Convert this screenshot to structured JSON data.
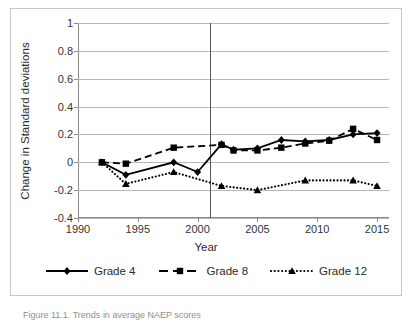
{
  "chart_data": {
    "type": "line",
    "title": "",
    "xlabel": "Year",
    "ylabel": "Change in Standard deviations",
    "xlim": [
      1990,
      2016
    ],
    "ylim": [
      -0.4,
      1.0
    ],
    "yticks": [
      1,
      0.8,
      0.6,
      0.4,
      0.2,
      0,
      -0.2,
      -0.4
    ],
    "ytick_labels": [
      "1",
      "0.8",
      "0.6",
      "0.4",
      "0.2",
      "0",
      "-0.2",
      "-0.4"
    ],
    "xticks": [
      1990,
      1995,
      2000,
      2005,
      2010,
      2015
    ],
    "xtick_labels": [
      "1990",
      "1995",
      "2000",
      "2005",
      "2010",
      "2015"
    ],
    "grid": true,
    "legend_position": "bottom",
    "annotations": [
      {
        "name": "reference-line",
        "type": "vline",
        "x": 2001
      }
    ],
    "series": [
      {
        "name": "Grade 4",
        "marker": "diamond",
        "linestyle": "solid",
        "color": "#000000",
        "points": [
          {
            "x": 1992,
            "y": 0.0
          },
          {
            "x": 1994,
            "y": -0.09
          },
          {
            "x": 1998,
            "y": 0.0
          },
          {
            "x": 2000,
            "y": -0.07
          },
          {
            "x": 2002,
            "y": 0.13
          },
          {
            "x": 2003,
            "y": 0.09
          },
          {
            "x": 2005,
            "y": 0.1
          },
          {
            "x": 2007,
            "y": 0.16
          },
          {
            "x": 2009,
            "y": 0.15
          },
          {
            "x": 2011,
            "y": 0.16
          },
          {
            "x": 2013,
            "y": 0.2
          },
          {
            "x": 2015,
            "y": 0.21
          }
        ]
      },
      {
        "name": "Grade 8",
        "marker": "square",
        "linestyle": "dashed",
        "color": "#000000",
        "points": [
          {
            "x": 1992,
            "y": 0.0
          },
          {
            "x": 1994,
            "y": -0.01
          },
          {
            "x": 1998,
            "y": 0.105
          },
          {
            "x": 2002,
            "y": 0.125
          },
          {
            "x": 2003,
            "y": 0.085
          },
          {
            "x": 2005,
            "y": 0.085
          },
          {
            "x": 2007,
            "y": 0.105
          },
          {
            "x": 2009,
            "y": 0.135
          },
          {
            "x": 2011,
            "y": 0.155
          },
          {
            "x": 2013,
            "y": 0.24
          },
          {
            "x": 2015,
            "y": 0.16
          }
        ]
      },
      {
        "name": "Grade 12",
        "marker": "triangle",
        "linestyle": "dotted",
        "color": "#000000",
        "points": [
          {
            "x": 1992,
            "y": 0.0
          },
          {
            "x": 1994,
            "y": -0.155
          },
          {
            "x": 1998,
            "y": -0.07
          },
          {
            "x": 2002,
            "y": -0.17
          },
          {
            "x": 2005,
            "y": -0.2
          },
          {
            "x": 2009,
            "y": -0.13
          },
          {
            "x": 2013,
            "y": -0.13
          },
          {
            "x": 2015,
            "y": -0.17
          }
        ]
      }
    ]
  },
  "legend": {
    "items": [
      {
        "label": "Grade 4"
      },
      {
        "label": "Grade 8"
      },
      {
        "label": "Grade 12"
      }
    ]
  },
  "caption": {
    "text": "Figure 11.1. Trends in average NAEP scores"
  }
}
